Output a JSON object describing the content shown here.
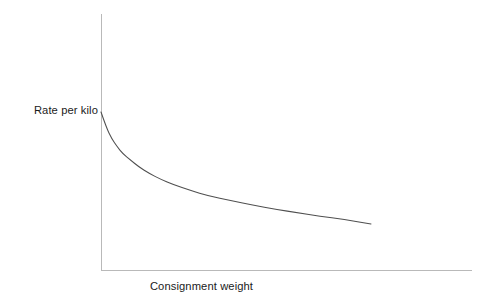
{
  "chart_data": {
    "type": "line",
    "title": "",
    "subtitle": "",
    "xlabel": "Consignment weight",
    "ylabel": "Rate per kilo",
    "grid": false,
    "legend": false,
    "legend_position": "none",
    "annotations": [],
    "xticklabels": [],
    "yticklabels": [],
    "xlim": [
      0,
      1
    ],
    "ylim": [
      0,
      1
    ],
    "axis_color": "#b9b9b9",
    "curve_color": "#4f4f4f",
    "background_color": "#ffffff",
    "series": [
      {
        "name": "Rate per kilo",
        "x": [
          0.0,
          0.02,
          0.04,
          0.06,
          0.08,
          0.11,
          0.14,
          0.18,
          0.22,
          0.27,
          0.33,
          0.4,
          0.48,
          0.56,
          0.65,
          0.73,
          0.81,
          0.9,
          1.0
        ],
        "y": [
          1.0,
          0.86,
          0.76,
          0.69,
          0.63,
          0.57,
          0.51,
          0.45,
          0.4,
          0.35,
          0.3,
          0.25,
          0.21,
          0.17,
          0.13,
          0.1,
          0.07,
          0.04,
          0.0
        ]
      }
    ],
    "pixel_path": {
      "x_axis": {
        "x1": 101,
        "y1": 270,
        "x2": 472,
        "y2": 270
      },
      "y_axis": {
        "x1": 101,
        "y1": 14,
        "x2": 101,
        "y2": 270
      },
      "curve_start": {
        "x": 101,
        "y": 112
      },
      "curve_end": {
        "x": 371,
        "y": 224
      }
    }
  },
  "labels": {
    "y_axis_label": "Rate per kilo",
    "x_axis_label": "Consignment weight"
  }
}
